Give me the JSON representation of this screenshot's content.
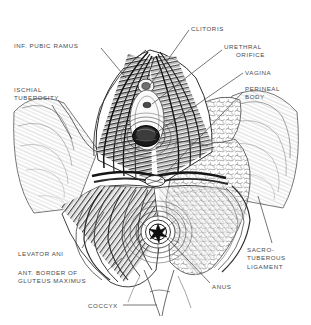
{
  "figure": {
    "type": "anatomical-line-illustration",
    "background_color": "#ffffff",
    "ink_color": "#3a3a3a",
    "label_color": "#4a4a4a"
  },
  "labels": [
    {
      "id": "inf-pubic-ramus",
      "lines": [
        "INF. PUBIC RAMUS"
      ],
      "x": 14,
      "y": 42,
      "align": "left",
      "leader": {
        "x1": 101,
        "y1": 48,
        "x2": 126,
        "y2": 78
      }
    },
    {
      "id": "ischial-tuberosity",
      "lines": [
        "ISCHIAL",
        "TUBEROSITY"
      ],
      "x": 14,
      "y": 86,
      "align": "left",
      "leader": {
        "x1": 52,
        "y1": 105,
        "x2": 72,
        "y2": 139
      }
    },
    {
      "id": "levator-ani",
      "lines": [
        "LEVATOR ANI"
      ],
      "x": 18,
      "y": 250,
      "align": "left",
      "leader": {
        "x1": 82,
        "y1": 248,
        "x2": 104,
        "y2": 212
      }
    },
    {
      "id": "ant-border-gluteus-maximus",
      "lines": [
        "ANT. BORDER OF",
        "GLUTEUS MAXIMUS"
      ],
      "x": 18,
      "y": 269,
      "align": "left",
      "leader": {
        "x1": 108,
        "y1": 270,
        "x2": 122,
        "y2": 258
      }
    },
    {
      "id": "coccyx",
      "lines": [
        "COCCYX"
      ],
      "x": 88,
      "y": 302,
      "align": "left",
      "leader": {
        "x1": 123,
        "y1": 305,
        "x2": 157,
        "y2": 305
      }
    },
    {
      "id": "clitoris",
      "lines": [
        "CLITORIS"
      ],
      "x": 191,
      "y": 25,
      "align": "left",
      "leader": {
        "x1": 189,
        "y1": 30,
        "x2": 150,
        "y2": 85
      }
    },
    {
      "id": "urethral-orifice",
      "lines": [
        "URETHRAL",
        "ORIFICE"
      ],
      "x": 224,
      "y": 43,
      "align": "left",
      "leader": {
        "x1": 222,
        "y1": 50,
        "x2": 152,
        "y2": 104
      }
    },
    {
      "id": "vagina",
      "lines": [
        "VAGINA"
      ],
      "x": 245,
      "y": 69,
      "align": "left",
      "leader": {
        "x1": 243,
        "y1": 73,
        "x2": 156,
        "y2": 133
      }
    },
    {
      "id": "perineal-body",
      "lines": [
        "PERINEAL",
        "BODY"
      ],
      "x": 245,
      "y": 85,
      "align": "left",
      "leader": {
        "x1": 243,
        "y1": 92,
        "x2": 158,
        "y2": 181
      }
    },
    {
      "id": "sacro-tuberous-ligament",
      "lines": [
        "SACRO-",
        "TUBEROUS",
        "LIGAMENT"
      ],
      "x": 247,
      "y": 246,
      "align": "left",
      "leader": {
        "x1": 272,
        "y1": 243,
        "x2": 258,
        "y2": 196
      }
    },
    {
      "id": "anus",
      "lines": [
        "ANUS"
      ],
      "x": 212,
      "y": 283,
      "align": "left",
      "leader": {
        "x1": 210,
        "y1": 283,
        "x2": 167,
        "y2": 238
      }
    }
  ],
  "structures": [
    {
      "id": "vaginal-orifice",
      "cx": 146,
      "cy": 136,
      "rx": 13,
      "ry": 10
    },
    {
      "id": "anal-orifice",
      "cx": 158,
      "cy": 232,
      "rx": 9,
      "ry": 9
    },
    {
      "id": "clitoral-region",
      "cx": 146,
      "cy": 86,
      "rx": 7,
      "ry": 6
    },
    {
      "id": "urethral-opening",
      "cx": 147,
      "cy": 105,
      "rx": 4,
      "ry": 3
    },
    {
      "id": "perineal-body-center",
      "cx": 155,
      "cy": 180,
      "rx": 10,
      "ry": 5
    },
    {
      "id": "ischiorectal-fat-right",
      "cx": 222,
      "cy": 210
    },
    {
      "id": "left-thigh",
      "cx": 48,
      "cy": 150
    },
    {
      "id": "right-thigh",
      "cx": 272,
      "cy": 150
    },
    {
      "id": "coccyx-tip",
      "cx": 160,
      "cy": 300
    }
  ]
}
